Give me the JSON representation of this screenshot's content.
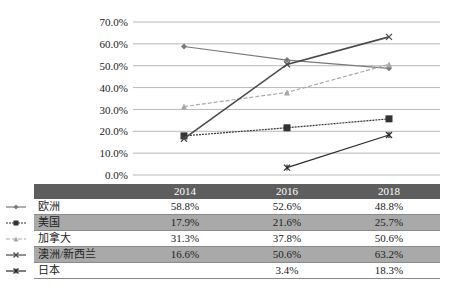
{
  "chart_data": {
    "type": "line",
    "title": "",
    "xlabel": "",
    "ylabel": "",
    "categories": [
      "2014",
      "2016",
      "2018"
    ],
    "ylim": [
      0,
      70
    ],
    "yticks": [
      "70.0%",
      "60.0%",
      "50.0%",
      "40.0%",
      "30.0%",
      "20.0%",
      "10.0%",
      "0.0%"
    ],
    "grid": true,
    "legend_position": "data-table-left",
    "series": [
      {
        "name": "欧洲",
        "values": [
          58.8,
          52.6,
          48.8
        ],
        "labels": [
          "58.8%",
          "52.6%",
          "48.8%"
        ],
        "marker": "diamond",
        "style": "solid",
        "color": "#7a7a7a"
      },
      {
        "name": "美国",
        "values": [
          17.9,
          21.6,
          25.7
        ],
        "labels": [
          "17.9%",
          "21.6%",
          "25.7%"
        ],
        "marker": "square",
        "style": "dotted",
        "color": "#333333"
      },
      {
        "name": "加拿大",
        "values": [
          31.3,
          37.8,
          50.6
        ],
        "labels": [
          "31.3%",
          "37.8%",
          "50.6%"
        ],
        "marker": "triangle",
        "style": "dashed",
        "color": "#a8a8a8"
      },
      {
        "name": "澳洲/新西兰",
        "values": [
          16.6,
          50.6,
          63.2
        ],
        "labels": [
          "16.6%",
          "50.6%",
          "63.2%"
        ],
        "marker": "x",
        "style": "solid",
        "color": "#4a4a4a"
      },
      {
        "name": "日本",
        "values": [
          null,
          3.4,
          18.3
        ],
        "labels": [
          "",
          "3.4%",
          "18.3%"
        ],
        "marker": "star",
        "style": "solid",
        "color": "#2a2a2a"
      }
    ]
  },
  "colors": {
    "header_bg": "#5e5e5e",
    "row_shade": "#a9a9a9",
    "gridline": "#b8b8b8"
  }
}
